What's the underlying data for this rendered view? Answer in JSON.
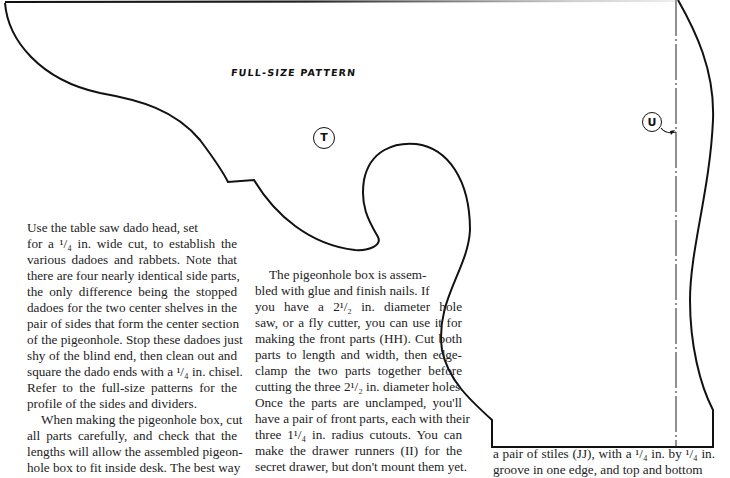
{
  "pattern": {
    "label": "FULL-SIZE PATTERN",
    "markers": [
      {
        "id": "T",
        "label": "T"
      },
      {
        "id": "U",
        "label": "U"
      }
    ]
  },
  "columns": {
    "left": {
      "lines": [
        "Use the table saw dado head, set",
        "for a ¹/₄ in. wide cut, to establish the",
        "various dadoes and rabbets. Note that",
        "there are four nearly identical side parts,",
        "the only difference being the stopped",
        "dadoes for the two center shelves in the",
        "pair of sides that form the center section",
        "of the pigeonhole. Stop these dadoes just",
        "shy of the blind end, then clean out and",
        "square the dado ends with a ¹/₄ in. chisel.",
        "Refer to the full-size patterns for the",
        "profile of the sides and dividers.",
        "When making the pigeonhole box, cut",
        "all parts carefully, and check that the",
        "lengths will allow the assembled pigeon-",
        "hole box to fit inside desk. The best way"
      ]
    },
    "middle": {
      "lines": [
        "The pigeonhole box is assem-",
        "bled with glue and finish nails. If",
        "you have a 2¹/₂ in. diameter hole",
        "saw, or a fly cutter, you can use it for",
        "making the front parts (HH). Cut both",
        "parts to length and width, then edge-",
        "clamp the two parts together before",
        "cutting the three 2¹/₂ in. diameter holes.",
        "Once the parts are unclamped, you'll",
        "have a pair of front parts, each with their",
        "three 1¹/₄ in. radius cutouts. You can",
        "make the drawer runners (II) for the",
        "secret drawer, but don't mount them yet."
      ]
    },
    "right": {
      "lines": [
        "a pair of stiles (JJ), with a ¹/₄ in. by ¹/₄ in.",
        "groove in one edge, and top and bottom"
      ]
    }
  }
}
